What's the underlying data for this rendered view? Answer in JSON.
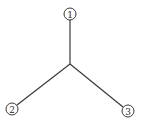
{
  "diagram": {
    "type": "tree",
    "center": {
      "x": 70,
      "y": 64
    },
    "nodes": [
      {
        "id": "1",
        "label": "1",
        "x": 70,
        "y": 14,
        "r": 6
      },
      {
        "id": "2",
        "label": "2",
        "x": 12,
        "y": 109,
        "r": 6
      },
      {
        "id": "3",
        "label": "3",
        "x": 128,
        "y": 111,
        "r": 6
      }
    ],
    "edges": [
      {
        "from": "center",
        "to": "1"
      },
      {
        "from": "center",
        "to": "2"
      },
      {
        "from": "center",
        "to": "3"
      }
    ],
    "colors": {
      "line": "#3a3a3a",
      "background": "#ffffff"
    }
  }
}
